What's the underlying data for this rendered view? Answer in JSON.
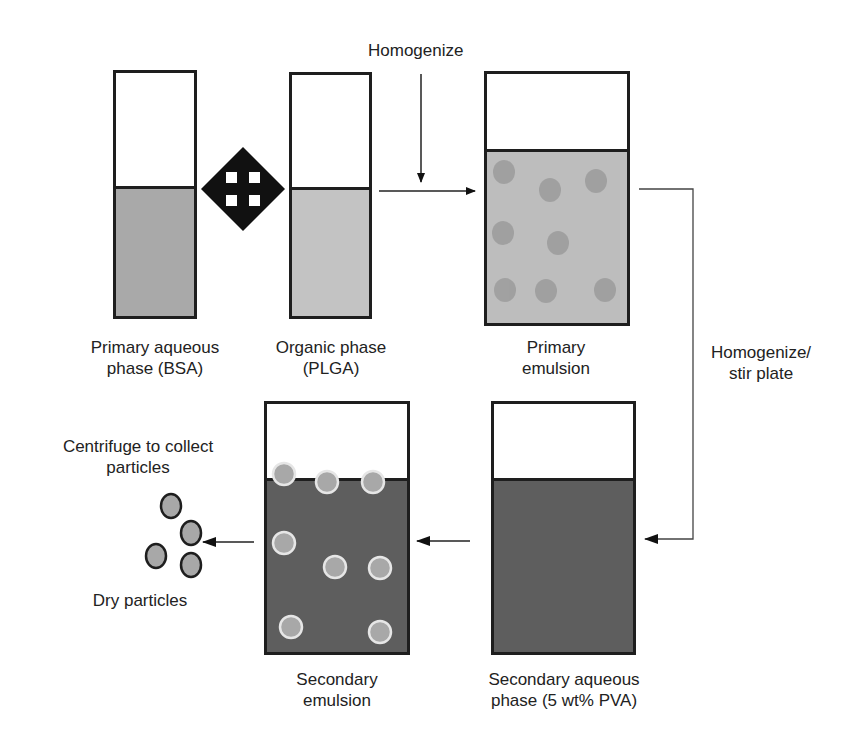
{
  "colors": {
    "outline": "#1e1e1e",
    "primary_aqueous_fill": "#a9a9a9",
    "organic_fill": "#c3c3c3",
    "primary_emulsion_fill": "#bdbdbd",
    "primary_droplet": "#9c9c9c",
    "secondary_aqueous_fill": "#5e5e5e",
    "secondary_particle": "#a8a8a8",
    "particle_ring": "#e6e6e6"
  },
  "steps": {
    "homogenize_top": "Homogenize",
    "homogenize_stir": "Homogenize/",
    "homogenize_stir_2": "stir plate",
    "centrifuge": "Centrifuge to collect",
    "centrifuge_2": "particles",
    "dry": "Dry particles"
  },
  "containers": [
    {
      "id": "primary-aqueous",
      "label_1": "Primary aqueous",
      "label_2": "phase (BSA)"
    },
    {
      "id": "organic",
      "label_1": "Organic phase",
      "label_2": "(PLGA)"
    },
    {
      "id": "primary-emulsion",
      "label_1": "Primary",
      "label_2": "emulsion"
    },
    {
      "id": "secondary-emulsion",
      "label_1": "Secondary",
      "label_2": "emulsion"
    },
    {
      "id": "secondary-aqueous",
      "label_1": "Secondary aqueous",
      "label_2": "phase (5 wt% PVA)"
    }
  ],
  "mixing_symbol": "four-way-arrow-icon"
}
